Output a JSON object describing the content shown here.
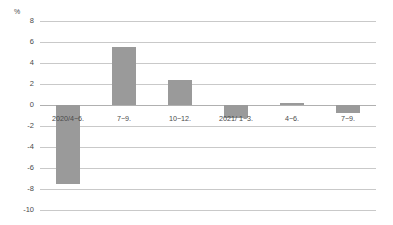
{
  "chart_data": {
    "type": "bar",
    "title": "",
    "subtitle": "",
    "xlabel": "",
    "ylabel": "%",
    "unit": "%",
    "categories": [
      "2020/4−6.",
      "7−9.",
      "10−12.",
      "2021/ 1−3.",
      "4−6.",
      "7−9."
    ],
    "values": [
      -7.5,
      5.5,
      2.4,
      -1.2,
      0.2,
      -0.8
    ],
    "series": [
      {
        "name": "",
        "values": [
          -7.5,
          5.5,
          2.4,
          -1.2,
          0.2,
          -0.8
        ]
      }
    ],
    "ylim": [
      -10,
      8
    ],
    "yticks": [
      8,
      6,
      4,
      2,
      0,
      -2,
      -4,
      -6,
      -8,
      -10
    ],
    "ytick_labels": [
      "8",
      "6",
      "4",
      "2",
      "0",
      "-2",
      "-4",
      "-6",
      "-8",
      "-10"
    ],
    "grid": true,
    "legend": false,
    "legend_position": "none",
    "bar_color": "#9a9a9a",
    "gridline_color": "#c9c9c9",
    "zeroline_color": "#b0b0b0",
    "text_color": "#4a4a4a",
    "background": "#ffffff"
  }
}
